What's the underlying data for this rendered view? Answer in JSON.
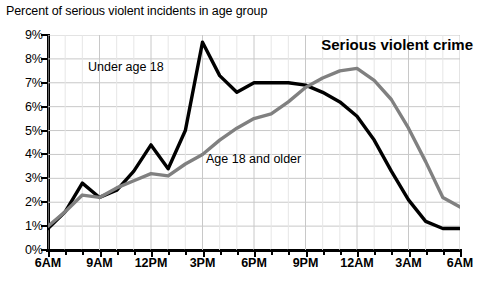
{
  "caption": "Percent of serious violent incidents in age group",
  "series_title": "Serious violent crime",
  "labels": {
    "under18": "Under age 18",
    "age18older": "Age 18 and older"
  },
  "colors": {
    "under18": "#000000",
    "age18older": "#808080",
    "grid": "#c8c8c8",
    "axis": "#000000",
    "background": "#ffffff"
  },
  "chart_data": {
    "type": "line",
    "title": "Serious violent crime",
    "subtitle": "Percent of serious violent incidents in age group",
    "xlabel": "",
    "ylabel": "Percent of serious violent incidents in age group",
    "ylim": [
      0,
      9
    ],
    "ytick_labels": [
      "0%",
      "1%",
      "2%",
      "3%",
      "4%",
      "5%",
      "6%",
      "7%",
      "8%",
      "9%"
    ],
    "ytick_values": [
      0,
      1,
      2,
      3,
      4,
      5,
      6,
      7,
      8,
      9
    ],
    "x": [
      "6AM",
      "7AM",
      "8AM",
      "9AM",
      "10AM",
      "11AM",
      "12PM",
      "1PM",
      "2PM",
      "3PM",
      "4PM",
      "5PM",
      "6PM",
      "7PM",
      "8PM",
      "9PM",
      "10PM",
      "11PM",
      "12AM",
      "1AM",
      "2AM",
      "3AM",
      "4AM",
      "5AM",
      "6AM"
    ],
    "xtick_labels": [
      "6AM",
      "9AM",
      "12PM",
      "3PM",
      "6PM",
      "9PM",
      "12AM",
      "3AM",
      "6AM"
    ],
    "xtick_label_indices": [
      0,
      3,
      6,
      9,
      12,
      15,
      18,
      21,
      24
    ],
    "grid": true,
    "legend": "inline-annotations",
    "series": [
      {
        "name": "Under age 18",
        "color": "#000000",
        "values": [
          0.9,
          1.6,
          2.8,
          2.2,
          2.5,
          3.3,
          4.4,
          3.4,
          5.0,
          8.7,
          7.3,
          6.6,
          7.0,
          7.0,
          7.0,
          6.9,
          6.6,
          6.2,
          5.6,
          4.6,
          3.3,
          2.1,
          1.2,
          0.9,
          0.9
        ]
      },
      {
        "name": "Age 18 and older",
        "color": "#808080",
        "values": [
          1.0,
          1.6,
          2.3,
          2.2,
          2.6,
          2.9,
          3.2,
          3.1,
          3.6,
          4.0,
          4.6,
          5.1,
          5.5,
          5.7,
          6.2,
          6.8,
          7.2,
          7.5,
          7.6,
          7.1,
          6.3,
          5.1,
          3.7,
          2.2,
          1.8
        ]
      }
    ]
  }
}
